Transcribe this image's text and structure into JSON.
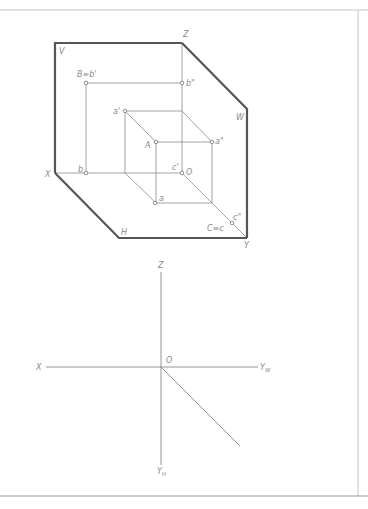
{
  "figure_upper": {
    "title": "Three-plane projection system (isometric view)",
    "plane_labels": {
      "V": "V",
      "W": "W",
      "H": "H"
    },
    "axis_labels": {
      "X": "X",
      "Y": "Y",
      "Z": "Z",
      "O": "O"
    },
    "point_labels": {
      "B_b_prime": "B≡b'",
      "b_double_prime": "b\"",
      "a_prime": "a'",
      "A": "A",
      "a_double_prime": "a\"",
      "c_prime": "c'",
      "b": "b",
      "a": "a",
      "C_c": "C≡c",
      "c_double_prime": "c\""
    },
    "colors": {
      "plane_edge": "#555555",
      "projection_line": "#8c8c8c",
      "label": "#8a8a8a"
    }
  },
  "figure_lower": {
    "title": "Projection axes (unfolded)",
    "axis_labels": {
      "Z": "Z",
      "X": "X",
      "O": "O",
      "Y_W_base": "Y",
      "Y_W_sub": "W",
      "Y_H_base": "Y",
      "Y_H_sub": "H"
    }
  }
}
